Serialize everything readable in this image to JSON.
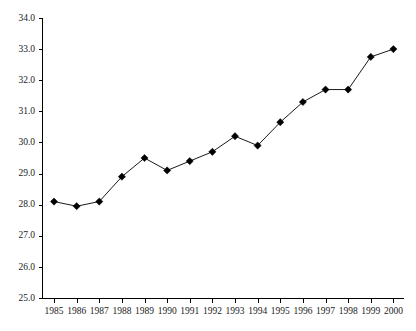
{
  "chart_data": {
    "type": "line",
    "title": "",
    "subtitle": "",
    "xlabel": "",
    "ylabel": "",
    "categories": [
      "1985",
      "1986",
      "1987",
      "1988",
      "1989",
      "1990",
      "1991",
      "1992",
      "1993",
      "1994",
      "1995",
      "1996",
      "1997",
      "1998",
      "1999",
      "2000"
    ],
    "x": [
      1985,
      1986,
      1987,
      1988,
      1989,
      1990,
      1991,
      1992,
      1993,
      1994,
      1995,
      1996,
      1997,
      1998,
      1999,
      2000
    ],
    "values": [
      28.1,
      27.95,
      28.1,
      28.9,
      29.5,
      29.1,
      29.4,
      29.7,
      30.2,
      29.9,
      30.65,
      31.3,
      31.7,
      31.7,
      32.75,
      33.0
    ],
    "series": [
      {
        "name": "",
        "values": [
          28.1,
          27.95,
          28.1,
          28.9,
          29.5,
          29.1,
          29.4,
          29.7,
          30.2,
          29.9,
          30.65,
          31.3,
          31.7,
          31.7,
          32.75,
          33.0
        ]
      }
    ],
    "ylim": [
      25.0,
      34.0
    ],
    "ytick_values": [
      25.0,
      26.0,
      27.0,
      28.0,
      29.0,
      30.0,
      31.0,
      32.0,
      33.0,
      34.0
    ],
    "ytick_labels": [
      "25.0",
      "26.0",
      "27.0",
      "28.0",
      "29.0",
      "30.0",
      "31.0",
      "32.0",
      "33.0",
      "34.0"
    ],
    "xtick_labels": [
      "1985",
      "1986",
      "1987",
      "1988",
      "1989",
      "1990",
      "1991",
      "1992",
      "1993",
      "1994",
      "1995",
      "1996",
      "1997",
      "1998",
      "1999",
      "2000"
    ],
    "grid": false,
    "legend": null,
    "legend_position": "none",
    "marker": "diamond",
    "line_color": "#000000",
    "marker_color": "#000000",
    "background_color": "#ffffff",
    "annotations": []
  }
}
